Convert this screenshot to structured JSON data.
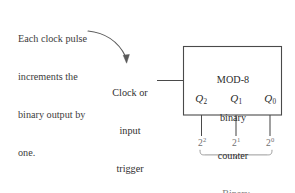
{
  "figure": {
    "background_color": "#ffffff",
    "line_color": "#4a4a4a",
    "muted_color": "#8a8a8a"
  },
  "annotation": {
    "name": "clock-pulse-annotation",
    "lines": [
      "Each clock pulse",
      "increments the",
      "binary output by",
      "one."
    ],
    "arrow": "curved-arrow-down-right"
  },
  "clock_input": {
    "name": "clock-or-input-trigger",
    "lines": [
      "Clock or",
      "input",
      "trigger"
    ]
  },
  "counter_block": {
    "name": "mod-8-binary-counter",
    "lines": [
      "MOD-8",
      "binary",
      "counter"
    ],
    "outputs": [
      {
        "symbol": "Q",
        "subscript": "2",
        "power_base": "2",
        "power_exponent": "2"
      },
      {
        "symbol": "Q",
        "subscript": "1",
        "power_base": "2",
        "power_exponent": "1"
      },
      {
        "symbol": "Q",
        "subscript": "0",
        "power_base": "2",
        "power_exponent": "0"
      }
    ]
  },
  "binary_output_caption": {
    "name": "binary-output-caption",
    "lines": [
      "Binary",
      "output"
    ]
  }
}
